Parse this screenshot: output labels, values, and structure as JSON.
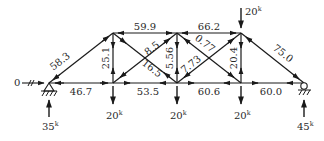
{
  "diagram": {
    "type": "truss-force-diagram",
    "units_suffix": "k",
    "nodes": {
      "A": {
        "x": 49,
        "y": 83,
        "support": "pin"
      },
      "B": {
        "x": 113,
        "y": 83
      },
      "C": {
        "x": 177,
        "y": 83
      },
      "D": {
        "x": 241,
        "y": 83
      },
      "E": {
        "x": 304,
        "y": 83,
        "support": "roller"
      },
      "F": {
        "x": 113,
        "y": 33
      },
      "G": {
        "x": 177,
        "y": 33
      },
      "H": {
        "x": 241,
        "y": 33
      }
    },
    "members": [
      {
        "id": "AF",
        "label": "58.3",
        "lx": 44,
        "ly": 62,
        "rot": -38
      },
      {
        "id": "AB",
        "label": "46.7",
        "lx": 67,
        "ly": 95,
        "rot": 0
      },
      {
        "id": "BC",
        "label": "53.5",
        "lx": 139,
        "ly": 95,
        "rot": 0
      },
      {
        "id": "CD",
        "label": "60.6",
        "lx": 202,
        "ly": 95,
        "rot": 0
      },
      {
        "id": "DE",
        "label": "60.0",
        "lx": 264,
        "ly": 95,
        "rot": 0
      },
      {
        "id": "FG",
        "label": "59.9",
        "lx": 135,
        "ly": 29,
        "rot": 0
      },
      {
        "id": "GH",
        "label": "66.2",
        "lx": 199,
        "ly": 29,
        "rot": 0
      },
      {
        "id": "FB",
        "label": "25.1",
        "lx": 108,
        "ly": 60,
        "rot": -90
      },
      {
        "id": "GC",
        "label": "5.56",
        "lx": 172,
        "ly": 60,
        "rot": -90
      },
      {
        "id": "HD",
        "label": "20.4",
        "lx": 236,
        "ly": 60,
        "rot": -90
      },
      {
        "id": "FC",
        "label": "16.5",
        "lx": 140,
        "ly": 74,
        "rot": 38
      },
      {
        "id": "BG",
        "label": "8.5",
        "lx": 146,
        "ly": 50,
        "rot": -38
      },
      {
        "id": "GD",
        "label": "0.77",
        "lx": 196,
        "ly": 47,
        "rot": 38
      },
      {
        "id": "CH",
        "label": "7.73",
        "lx": 184,
        "ly": 72,
        "rot": -38
      },
      {
        "id": "HE",
        "label": "75.0",
        "lx": 270,
        "ly": 56,
        "rot": 38
      }
    ],
    "loads": [
      {
        "id": "load-top-H",
        "value": "20",
        "unit": "k",
        "node": "H",
        "direction": "down"
      },
      {
        "id": "load-B",
        "value": "20",
        "unit": "k",
        "node": "B",
        "direction": "down"
      },
      {
        "id": "load-C",
        "value": "20",
        "unit": "k",
        "node": "C",
        "direction": "down"
      },
      {
        "id": "load-D",
        "value": "20",
        "unit": "k",
        "node": "D",
        "direction": "down"
      }
    ],
    "reactions": [
      {
        "id": "reaction-A-vertical",
        "value": "35",
        "unit": "k",
        "node": "A",
        "direction": "up"
      },
      {
        "id": "reaction-A-horizontal",
        "value": "0",
        "unit": "",
        "node": "A",
        "direction": "right"
      },
      {
        "id": "reaction-E-vertical",
        "value": "45",
        "unit": "k",
        "node": "E",
        "direction": "up"
      }
    ]
  },
  "labels": {
    "AF": "58.3",
    "AB": "46.7",
    "BC": "53.5",
    "CD": "60.6",
    "DE": "60.0",
    "FG": "59.9",
    "GH": "66.2",
    "FB": "25.1",
    "GC": "5.56",
    "HD": "20.4",
    "FC": "16.5",
    "BG": "8.5",
    "GD": "0.77",
    "CH": "7.73",
    "HE": "75.0",
    "load_H": "20",
    "load_B": "20",
    "load_C": "20",
    "load_D": "20",
    "reaction_A": "35",
    "reaction_A_h": "0",
    "reaction_E": "45",
    "kip_unit": "k"
  }
}
